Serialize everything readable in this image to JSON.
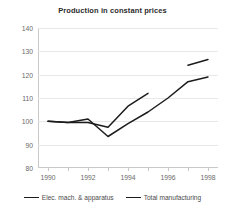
{
  "chart_data": {
    "type": "line",
    "title": "Production in constant prices",
    "xlabel": "",
    "ylabel": "",
    "xlim": [
      1989.5,
      1998.5
    ],
    "ylim": [
      80,
      140
    ],
    "yticks": [
      80,
      90,
      100,
      110,
      120,
      130,
      140
    ],
    "xticks": [
      1990,
      1991,
      1992,
      1993,
      1994,
      1995,
      1996,
      1997,
      1998
    ],
    "xtick_labels_shown": [
      1990,
      1992,
      1994,
      1996,
      1998
    ],
    "grid": true,
    "legend_position": "bottom",
    "line_color": "#1c1c1c",
    "series": [
      {
        "name": "Elec. mach. & apparatus",
        "x": [
          1990,
          1991,
          1992,
          1993,
          1994,
          1995,
          1997,
          1998
        ],
        "values": [
          100,
          99.5,
          99.5,
          97.5,
          106.5,
          112,
          124,
          126.5
        ],
        "gaps": [
          [
            1995,
            1997
          ]
        ]
      },
      {
        "name": "Total manufacturing",
        "x": [
          1990,
          1991,
          1992,
          1993,
          1994,
          1995,
          1996,
          1997,
          1998
        ],
        "values": [
          100,
          99.5,
          101,
          93.5,
          99,
          104,
          110,
          117,
          119
        ]
      }
    ]
  },
  "legend": {
    "items": [
      {
        "label": "Elec. mach. & apparatus"
      },
      {
        "label": "Total manufacturing"
      }
    ]
  }
}
